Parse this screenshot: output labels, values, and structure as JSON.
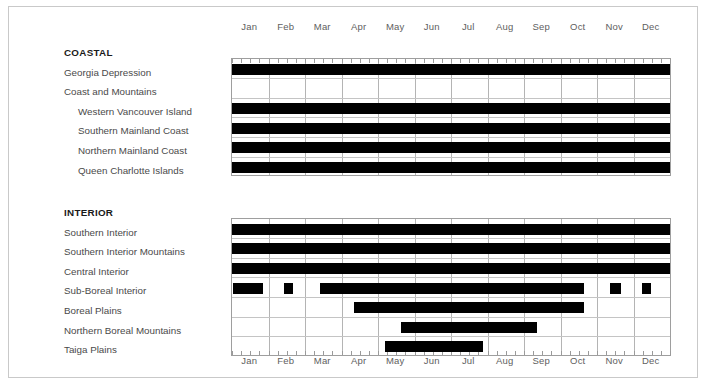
{
  "chart_data": {
    "type": "bar",
    "title": "",
    "subtitle": "",
    "xlabel": "",
    "ylabel": "",
    "orientation": "horizontal",
    "plot_kind": "gantt-timeline",
    "grid": true,
    "legend": null,
    "x_axis": {
      "type": "month",
      "range": [
        0,
        12
      ],
      "tick_labels": [
        "Jan",
        "Feb",
        "Mar",
        "Apr",
        "May",
        "Jun",
        "Jul",
        "Aug",
        "Sep",
        "Oct",
        "Nov",
        "Dec"
      ],
      "minor_ticks_per_month": 4,
      "labels_top": true,
      "labels_bottom": true
    },
    "bar_color": "#000000",
    "groups": [
      {
        "name": "COASTAL",
        "heading": true,
        "rows": [
          {
            "label": "Georgia Depression",
            "indent": 0,
            "spans": [
              [
                0.0,
                12.0
              ]
            ]
          },
          {
            "label": "Coast and Mountains",
            "indent": 0,
            "spans": []
          },
          {
            "label": "Western Vancouver Island",
            "indent": 1,
            "spans": [
              [
                0.0,
                12.0
              ]
            ]
          },
          {
            "label": "Southern Mainland Coast",
            "indent": 1,
            "spans": [
              [
                0.0,
                12.0
              ]
            ]
          },
          {
            "label": "Northern Mainland Coast",
            "indent": 1,
            "spans": [
              [
                0.0,
                12.0
              ]
            ]
          },
          {
            "label": "Queen Charlotte Islands",
            "indent": 1,
            "spans": [
              [
                0.0,
                12.0
              ]
            ]
          }
        ]
      },
      {
        "name": "INTERIOR",
        "heading": true,
        "rows": [
          {
            "label": "Southern Interior",
            "indent": 0,
            "spans": [
              [
                0.0,
                12.0
              ]
            ]
          },
          {
            "label": "Southern Interior Mountains",
            "indent": 0,
            "spans": [
              [
                0.0,
                12.0
              ]
            ]
          },
          {
            "label": "Central Interior",
            "indent": 0,
            "spans": [
              [
                0.0,
                12.0
              ]
            ]
          },
          {
            "label": "Sub-Boreal Interior",
            "indent": 0,
            "spans": [
              [
                0.03,
                0.85
              ],
              [
                1.42,
                1.67
              ],
              [
                2.41,
                9.64
              ],
              [
                10.35,
                10.66
              ],
              [
                11.23,
                11.48
              ]
            ]
          },
          {
            "label": "Boreal Plains",
            "indent": 0,
            "spans": [
              [
                3.34,
                9.64
              ]
            ]
          },
          {
            "label": "Northern Boreal Mountains",
            "indent": 0,
            "spans": [
              [
                4.63,
                8.36
              ]
            ]
          },
          {
            "label": "Taiga Plains",
            "indent": 0,
            "spans": [
              [
                4.19,
                6.88
              ]
            ]
          }
        ]
      }
    ]
  }
}
